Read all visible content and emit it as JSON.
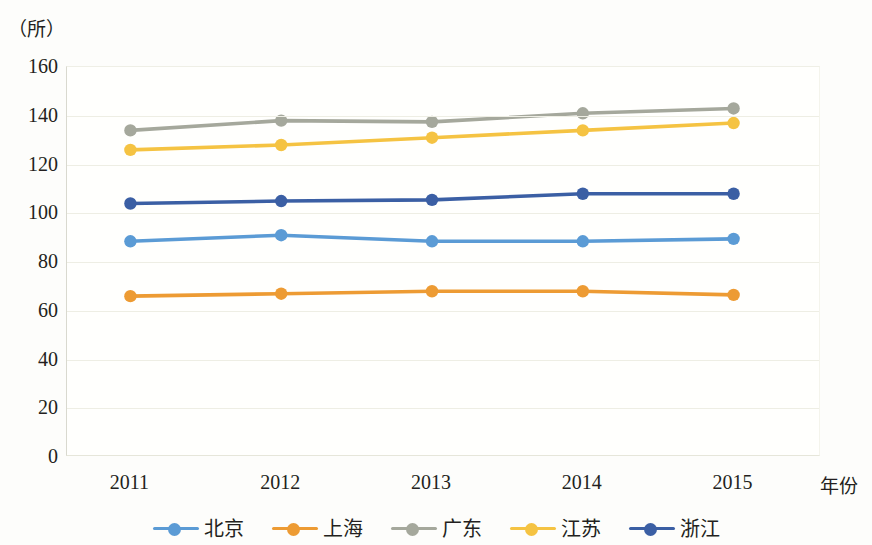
{
  "chart_data": {
    "type": "line",
    "title": "",
    "subtitle": "",
    "xlabel": "年份",
    "ylabel": "（所）",
    "unit_label": "（所）",
    "categories": [
      "2011",
      "2012",
      "2013",
      "2014",
      "2015"
    ],
    "x": [
      2011,
      2012,
      2013,
      2014,
      2015
    ],
    "ylim": [
      0,
      160
    ],
    "yticks": [
      160,
      140,
      120,
      100,
      80,
      60,
      40,
      20,
      0
    ],
    "grid": true,
    "legend_position": "bottom",
    "series": [
      {
        "name": "北京",
        "color": "#5b9bd5",
        "values": [
          88.5,
          91,
          88.5,
          88.5,
          89.5
        ]
      },
      {
        "name": "上海",
        "color": "#ed9b33",
        "values": [
          66,
          67,
          68,
          68,
          66.5
        ]
      },
      {
        "name": "广东",
        "color": "#a5a89c",
        "values": [
          134,
          138,
          137.5,
          141,
          143
        ]
      },
      {
        "name": "江苏",
        "color": "#f5c342",
        "values": [
          126,
          128,
          131,
          134,
          137
        ]
      },
      {
        "name": "浙江",
        "color": "#3b5fa4",
        "values": [
          104,
          105,
          105.5,
          108,
          108
        ]
      }
    ]
  },
  "legend": {
    "items": [
      {
        "label": "北京"
      },
      {
        "label": "上海"
      },
      {
        "label": "广东"
      },
      {
        "label": "江苏"
      },
      {
        "label": "浙江"
      }
    ]
  }
}
